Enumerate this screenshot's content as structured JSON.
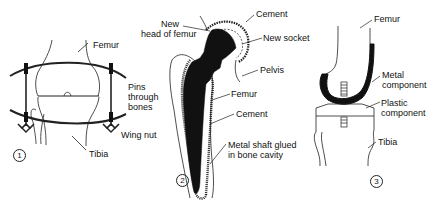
{
  "figures": [
    {
      "number": "1",
      "labels": {
        "femur": "Femur",
        "pins_line1": "Pins",
        "pins_line2": "through",
        "pins_line3": "bones",
        "wing_nut": "Wing nut",
        "tibia": "Tibia"
      }
    },
    {
      "number": "2",
      "labels": {
        "new_head_line1": "New",
        "new_head_line2": "head of femur",
        "cement_top": "Cement",
        "new_socket": "New socket",
        "pelvis": "Pelvis",
        "femur": "Femur",
        "cement_mid": "Cement",
        "shaft_line1": "Metal shaft glued",
        "shaft_line2": "in bone cavity"
      }
    },
    {
      "number": "3",
      "labels": {
        "femur": "Femur",
        "metal_line1": "Metal",
        "metal_line2": "component",
        "plastic_line1": "Plastic",
        "plastic_line2": "component",
        "tibia": "Tibia"
      }
    }
  ],
  "colors": {
    "ink": "#111111",
    "background": "#ffffff"
  }
}
